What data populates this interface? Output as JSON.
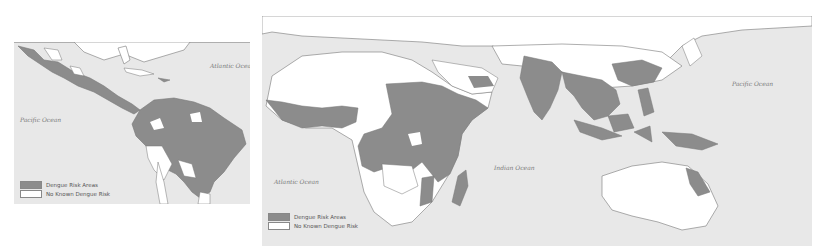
{
  "colors": {
    "risk": "#8c8c8c",
    "no_risk": "#ffffff",
    "ocean": "#e8e8e8",
    "border": "#777777"
  },
  "americas_map": {
    "ocean_labels": {
      "atlantic": "Atlantic Ocean",
      "pacific": "Pacific Ocean"
    },
    "legend": {
      "risk_label": "Dengue Risk Areas",
      "no_risk_label": "No Known Dengue Risk"
    }
  },
  "world_map": {
    "ocean_labels": {
      "atlantic": "Atlantic Ocean",
      "indian": "Indian Ocean",
      "pacific": "Pacific Ocean"
    },
    "legend": {
      "risk_label": "Dengue Risk Areas",
      "no_risk_label": "No Known Dengue Risk"
    }
  }
}
